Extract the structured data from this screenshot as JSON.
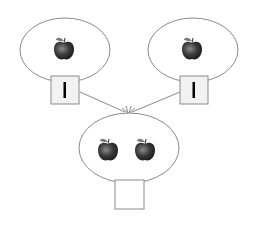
{
  "diagram": {
    "type": "number-bond-addition",
    "nodes": [
      {
        "id": "left-part",
        "apples": 1,
        "box_value": "1"
      },
      {
        "id": "right-part",
        "apples": 1,
        "box_value": "1"
      },
      {
        "id": "whole",
        "apples": 2,
        "box_value": ""
      }
    ],
    "edges": [
      {
        "from": "left-part",
        "to": "whole"
      },
      {
        "from": "right-part",
        "to": "whole"
      }
    ],
    "icon": "apple-icon",
    "colors": {
      "outline": "#8a8a8a",
      "box_fill": "#f2f2f2",
      "apple": "#3a3a3a",
      "text": "#000000"
    }
  }
}
